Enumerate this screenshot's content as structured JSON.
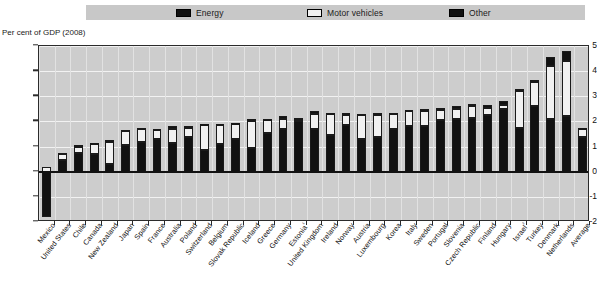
{
  "legend": {
    "items": [
      {
        "label": "Energy",
        "color": "#111111",
        "icon": "filled-square-swatch"
      },
      {
        "label": "Motor vehicles",
        "color": "#f1f1f1",
        "icon": "empty-square-swatch"
      },
      {
        "label": "Other",
        "color": "#111111",
        "icon": "filled-square-swatch"
      }
    ]
  },
  "axis_caption": "Per cent of GDP (2008)",
  "chart_data": {
    "type": "bar",
    "stacked": true,
    "title": "",
    "subtitle": "Per cent of GDP (2008)",
    "xlabel": "",
    "ylabel": "Per cent of GDP (2008)",
    "ylim": [
      -2,
      5
    ],
    "yticks": [
      -2,
      -1,
      0,
      1,
      2,
      3,
      4,
      5
    ],
    "grid": true,
    "legend_position": "top",
    "categories": [
      "Mexico",
      "United States",
      "Chile",
      "Canada",
      "New Zealand",
      "Japan",
      "Spain",
      "France",
      "Australia",
      "Poland",
      "Switzerland",
      "Belgium",
      "Slovak Republic",
      "Iceland",
      "Greece",
      "Germany",
      "Estonia¹",
      "United Kingdom",
      "Ireland",
      "Norway",
      "Austria",
      "Luxembourg",
      "Korea",
      "Italy",
      "Sweden",
      "Portugal",
      "Slovenia",
      "Czech Republic",
      "Finland",
      "Hungary",
      "Israel²",
      "Turkey",
      "Denmark",
      "Netherlands",
      "Average"
    ],
    "series": [
      {
        "name": "Energy",
        "values": [
          -1.8,
          0.45,
          0.75,
          0.7,
          0.3,
          1.05,
          1.2,
          1.3,
          1.15,
          1.4,
          0.85,
          1.1,
          1.3,
          0.95,
          1.55,
          1.7,
          2.0,
          1.7,
          1.45,
          1.85,
          1.3,
          1.4,
          1.7,
          1.8,
          1.8,
          2.05,
          2.1,
          2.15,
          2.25,
          2.5,
          1.75,
          2.6,
          2.1,
          2.2,
          1.4
        ]
      },
      {
        "name": "Motor vehicles",
        "values": [
          0.2,
          0.25,
          0.25,
          0.4,
          0.9,
          0.55,
          0.5,
          0.35,
          0.55,
          0.35,
          1.0,
          0.75,
          0.6,
          1.05,
          0.5,
          0.4,
          0.05,
          0.6,
          0.85,
          0.4,
          0.95,
          0.85,
          0.6,
          0.6,
          0.6,
          0.4,
          0.4,
          0.45,
          0.3,
          0.15,
          1.45,
          0.95,
          2.1,
          2.2,
          0.3
        ]
      },
      {
        "name": "Other",
        "values": [
          0.0,
          0.05,
          0.05,
          0.05,
          0.05,
          0.05,
          0.05,
          0.05,
          0.1,
          0.05,
          0.05,
          0.05,
          0.05,
          0.1,
          0.05,
          0.1,
          0.1,
          0.1,
          0.05,
          0.1,
          0.05,
          0.1,
          0.05,
          0.05,
          0.1,
          0.1,
          0.1,
          0.1,
          0.1,
          0.15,
          0.1,
          0.1,
          0.35,
          0.4,
          0.05
        ]
      }
    ],
    "totals": [
      -1.6,
      0.75,
      1.05,
      1.15,
      1.25,
      1.65,
      1.75,
      1.7,
      1.8,
      1.8,
      1.9,
      1.9,
      1.95,
      2.1,
      2.1,
      2.2,
      2.15,
      2.4,
      2.35,
      2.35,
      2.3,
      2.35,
      2.35,
      2.45,
      2.5,
      2.55,
      2.6,
      2.7,
      2.65,
      2.8,
      3.3,
      3.65,
      4.55,
      4.8,
      1.75
    ]
  }
}
